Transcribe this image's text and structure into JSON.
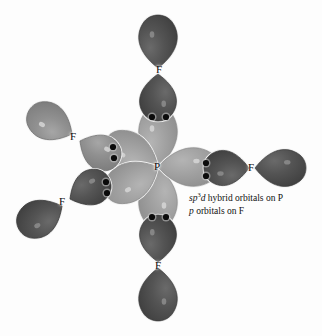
{
  "figure": {
    "type": "orbital-overlap-diagram",
    "molecule": "PF5",
    "geometry": "trigonal bipyramidal",
    "background_color": "#fdfdfd",
    "central_atom": {
      "label": "P",
      "x": 158,
      "y": 167,
      "name": "phosphorus"
    },
    "caption": {
      "x": 189,
      "y": 192,
      "line1_prefix": "sp",
      "line1_sup": "3",
      "line1_mid": "d",
      "line1_rest": " hybrid orbitals on P",
      "line2_prefix": "p",
      "line2_rest": " orbitals on F",
      "full_line1": "sp3d hybrid orbitals on P",
      "full_line2": "p orbitals on F"
    },
    "colors": {
      "hybrid_lobe_light": "#9e9e9e",
      "hybrid_lobe_light_edge": "#8a8a8a",
      "f_orbital_dark": "#4d4d4d",
      "f_orbital_medium": "#8b8b8b",
      "f_orbital_dark_edge": "#3a3a3a",
      "electron_dot": "#0b0b0b",
      "highlight": "#d8d8d8",
      "outline": "#f2f2f2"
    },
    "electron_dot_radius": 3.1,
    "bonds": [
      {
        "name": "axial-top",
        "label": "F",
        "label_x": 160,
        "label_y": 70,
        "angle_deg": -90,
        "hybrid_lobe": {
          "cx": 158,
          "cy": 167,
          "len": 62,
          "width": 46,
          "shade": "light"
        },
        "f_proximal": {
          "cx": 158,
          "cy": 74,
          "len": 48,
          "width": 44,
          "shade": "dark"
        },
        "f_distal": {
          "cx": 158,
          "cy": 68,
          "len": 54,
          "width": 46,
          "shade": "dark"
        },
        "dots": [
          {
            "x": 152,
            "y": 117
          },
          {
            "x": 166,
            "y": 117
          }
        ]
      },
      {
        "name": "axial-bottom",
        "label": "F",
        "label_x": 159,
        "label_y": 266,
        "angle_deg": 90,
        "hybrid_lobe": {
          "cx": 158,
          "cy": 167,
          "len": 62,
          "width": 46,
          "shade": "light"
        },
        "f_proximal": {
          "cx": 158,
          "cy": 262,
          "len": 48,
          "width": 44,
          "shade": "dark"
        },
        "f_distal": {
          "cx": 158,
          "cy": 268,
          "len": 54,
          "width": 46,
          "shade": "dark"
        },
        "dots": [
          {
            "x": 152,
            "y": 217
          },
          {
            "x": 166,
            "y": 217
          }
        ]
      },
      {
        "name": "equatorial-right",
        "label": "F",
        "label_x": 252,
        "label_y": 168,
        "angle_deg": 0,
        "hybrid_lobe": {
          "cx": 158,
          "cy": 167,
          "len": 62,
          "width": 46,
          "shade": "light"
        },
        "f_proximal": {
          "cx": 249,
          "cy": 168,
          "len": 46,
          "width": 42,
          "shade": "dark"
        },
        "f_distal": {
          "cx": 255,
          "cy": 168,
          "len": 52,
          "width": 44,
          "shade": "dark"
        },
        "dots": [
          {
            "x": 206,
            "y": 163
          },
          {
            "x": 206,
            "y": 176
          }
        ]
      },
      {
        "name": "equatorial-upper-left",
        "label": "F",
        "label_x": 74,
        "label_y": 137,
        "angle_deg": 208,
        "hybrid_lobe": {
          "cx": 158,
          "cy": 167,
          "len": 60,
          "width": 46,
          "shade": "light"
        },
        "f_proximal": {
          "cx": 80,
          "cy": 141,
          "len": 45,
          "width": 42,
          "shade": "medium"
        },
        "f_distal": {
          "cx": 72,
          "cy": 134,
          "len": 50,
          "width": 44,
          "shade": "medium"
        },
        "dots": [
          {
            "x": 113,
            "y": 147
          },
          {
            "x": 114,
            "y": 158
          }
        ]
      },
      {
        "name": "equatorial-lower-left",
        "label": "F",
        "label_x": 63,
        "label_y": 202,
        "angle_deg": 152,
        "hybrid_lobe": {
          "cx": 158,
          "cy": 167,
          "len": 60,
          "width": 46,
          "shade": "light"
        },
        "f_proximal": {
          "cx": 70,
          "cy": 199,
          "len": 45,
          "width": 42,
          "shade": "dark"
        },
        "f_distal": {
          "cx": 62,
          "cy": 206,
          "len": 50,
          "width": 44,
          "shade": "dark"
        },
        "dots": [
          {
            "x": 106,
            "y": 182
          },
          {
            "x": 107,
            "y": 193
          }
        ]
      }
    ]
  }
}
